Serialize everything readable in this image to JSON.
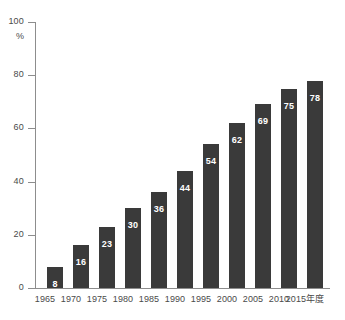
{
  "chart_data": {
    "type": "bar",
    "title": "",
    "subtitle": "",
    "xlabel": "",
    "ylabel": "%",
    "unit_label": "%",
    "categories": [
      "1965",
      "1970",
      "1975",
      "1980",
      "1985",
      "1990",
      "1995",
      "2000",
      "2005",
      "2010",
      "2015年度"
    ],
    "values": [
      8,
      16,
      23,
      30,
      36,
      44,
      54,
      62,
      69,
      75,
      78
    ],
    "series": [
      {
        "name": "",
        "values": [
          8,
          16,
          23,
          30,
          36,
          44,
          54,
          62,
          69,
          75,
          78
        ]
      }
    ],
    "data_labels": [
      "8",
      "16",
      "23",
      "30",
      "36",
      "44",
      "54",
      "62",
      "69",
      "75",
      "78"
    ],
    "ylim": [
      0,
      100
    ],
    "yticks": [
      0,
      20,
      40,
      60,
      80,
      100
    ],
    "ytick_labels": [
      "0",
      "20",
      "40",
      "60",
      "80",
      "100"
    ],
    "grid": false,
    "legend": false,
    "legend_position": "none",
    "bar_color": "#3a3a3a",
    "axis_color": "#8d8d8d",
    "text_color": "#4a4a4a",
    "data_label_color": "#ffffff",
    "background_color": "#ffffff"
  }
}
